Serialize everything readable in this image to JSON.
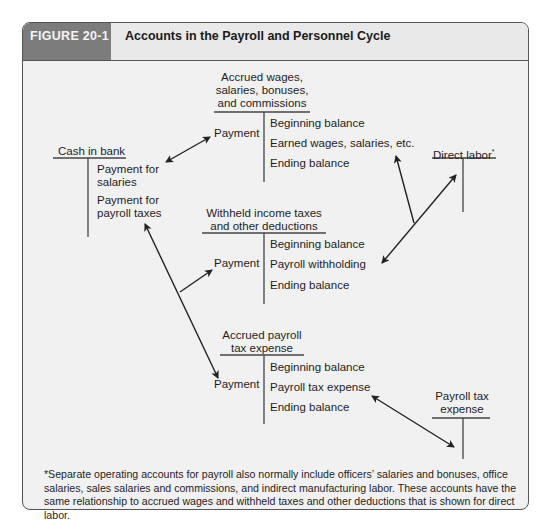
{
  "figure": {
    "label": "FIGURE 20-1",
    "title": "Accounts in the Payroll and Personnel Cycle"
  },
  "accounts": {
    "cash_in_bank": {
      "title": "Cash in bank",
      "credits": [
        "Payment for",
        "salaries",
        "Payment for",
        "payroll taxes"
      ]
    },
    "accrued_wages": {
      "title_lines": [
        "Accrued wages,",
        "salaries, bonuses,",
        "and commissions"
      ],
      "debit": "Payment",
      "credits": [
        "Beginning balance",
        "Earned wages, salaries, etc.",
        "Ending balance"
      ]
    },
    "direct_labor": {
      "title": "Direct labor",
      "marker": "*"
    },
    "withheld_taxes": {
      "title_lines": [
        "Withheld income taxes",
        "and other deductions"
      ],
      "debit": "Payment",
      "credits": [
        "Beginning balance",
        "Payroll withholding",
        "Ending balance"
      ]
    },
    "accrued_payroll_tax": {
      "title_lines": [
        "Accrued payroll",
        "tax expense"
      ],
      "debit": "Payment",
      "credits": [
        "Beginning balance",
        "Payroll tax expense",
        "Ending balance"
      ]
    },
    "payroll_tax_expense": {
      "title_lines": [
        "Payroll tax",
        "expense"
      ]
    }
  },
  "footnote": "*Separate operating accounts for payroll also normally include officers’ salaries and bonuses, office salaries, sales salaries and commissions, and indirect manufacturing labor. These accounts have the same relationship to accrued wages and withheld taxes and other deductions that is shown for direct labor.",
  "colors": {
    "label_bg": "#7c7c7c",
    "panel_bg": "#f1f1f1",
    "line": "#222222"
  }
}
